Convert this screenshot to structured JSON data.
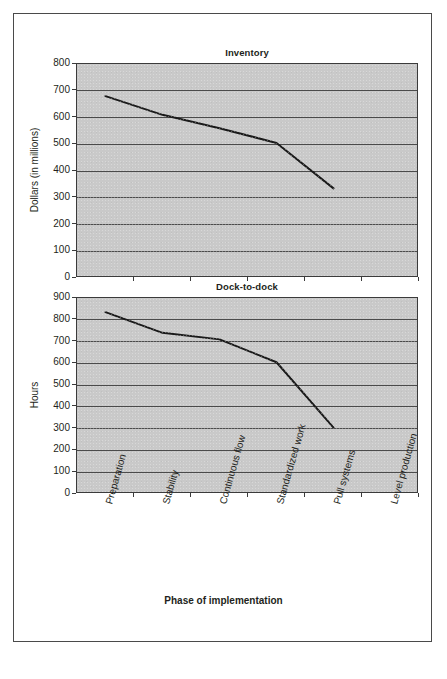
{
  "figure": {
    "border_color": "#4a4a4a",
    "panel_color": "#c9c9c9",
    "line_color": "#1a1a1a",
    "grid_color": "#4b4b4b",
    "xaxis_title": "Phase of implementation"
  },
  "categories": [
    "Preparation",
    "Stability",
    "Continuous flow",
    "Standardized work",
    "Pull systems",
    "Level production"
  ],
  "chart_data": [
    {
      "type": "line",
      "title": "Inventory",
      "xlabel": "Phase of implementation",
      "ylabel": "Dollars (in millions)",
      "categories": [
        "Preparation",
        "Stability",
        "Continuous flow",
        "Standardized work",
        "Pull systems",
        "Level production"
      ],
      "values": [
        680,
        610,
        560,
        505,
        335,
        null
      ],
      "ylim": [
        0,
        800
      ],
      "ytick_step": 100,
      "yticks": [
        0,
        100,
        200,
        300,
        400,
        500,
        600,
        700,
        800
      ],
      "ytick_labels": [
        "0",
        "100",
        "200",
        "300",
        "400",
        "500",
        "600",
        "700",
        "800"
      ],
      "grid": true,
      "legend": "none"
    },
    {
      "type": "line",
      "title": "Dock-to-dock",
      "xlabel": "Phase of implementation",
      "ylabel": "Hours",
      "categories": [
        "Preparation",
        "Stability",
        "Continuous flow",
        "Standardized work",
        "Pull systems",
        "Level production"
      ],
      "values": [
        835,
        740,
        710,
        605,
        305,
        null
      ],
      "ylim": [
        0,
        900
      ],
      "ytick_step": 100,
      "yticks": [
        0,
        100,
        200,
        300,
        400,
        500,
        600,
        700,
        800,
        900
      ],
      "ytick_labels": [
        "0",
        "100",
        "200",
        "300",
        "400",
        "500",
        "600",
        "700",
        "800",
        "900"
      ],
      "grid": true,
      "legend": "none"
    }
  ]
}
